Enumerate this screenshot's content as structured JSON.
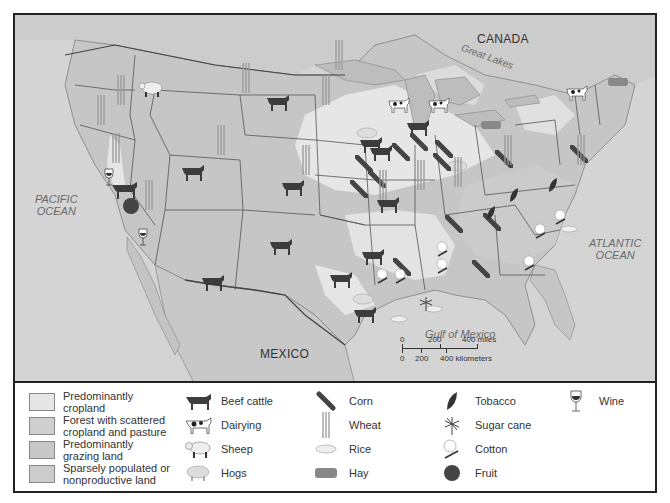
{
  "map": {
    "labels": {
      "canada": "CANADA",
      "great_lakes": "Great Lakes",
      "mexico": "MEXICO",
      "pacific": "PACIFIC\nOCEAN",
      "atlantic": "ATLANTIC\nOCEAN",
      "gulf": "Gulf of Mexico"
    },
    "scale": {
      "miles_ticks": [
        "0",
        "200",
        "400 miles"
      ],
      "km_ticks": [
        "0",
        "200",
        "400 kilometers"
      ]
    },
    "colors": {
      "water": "#d4d4d4",
      "cropland": "#e6e6e6",
      "forest": "#c9c9c9",
      "grazing": "#bfbfbf",
      "sparse": "#c4c4c4",
      "border": "#555555"
    }
  },
  "legend": {
    "land_use": [
      {
        "label": "Predominantly\ncropland",
        "color": "#e6e6e6"
      },
      {
        "label": "Forest with scattered\ncropland and pasture",
        "color": "#cfcfcf"
      },
      {
        "label": "Predominantly\ngrazing land",
        "color": "#c8c8c8"
      },
      {
        "label": "Sparsely populated or\nnonproductive land",
        "color": "#cccccc"
      }
    ],
    "products": [
      {
        "label": "Beef cattle",
        "icon": "beef-cattle-icon"
      },
      {
        "label": "Dairying",
        "icon": "dairy-cow-icon"
      },
      {
        "label": "Sheep",
        "icon": "sheep-icon"
      },
      {
        "label": "Hogs",
        "icon": "hog-icon"
      },
      {
        "label": "Corn",
        "icon": "corn-icon"
      },
      {
        "label": "Wheat",
        "icon": "wheat-icon"
      },
      {
        "label": "Rice",
        "icon": "rice-icon"
      },
      {
        "label": "Hay",
        "icon": "hay-icon"
      },
      {
        "label": "Tobacco",
        "icon": "tobacco-leaf-icon"
      },
      {
        "label": "Sugar cane",
        "icon": "sugar-cane-icon"
      },
      {
        "label": "Cotton",
        "icon": "cotton-icon"
      },
      {
        "label": "Fruit",
        "icon": "fruit-icon"
      },
      {
        "label": "Wine",
        "icon": "wine-glass-icon"
      }
    ]
  }
}
